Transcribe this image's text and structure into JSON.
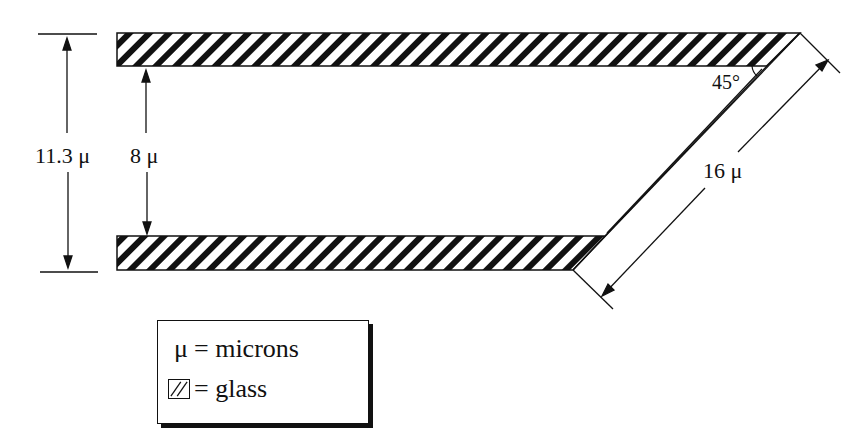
{
  "diagram": {
    "labels": {
      "outer_height": "11.3 μ",
      "inner_height": "8 μ",
      "diagonal_length": "16 μ",
      "angle": "45°"
    }
  },
  "legend": {
    "items": [
      {
        "symbol": "μ",
        "text": "= microns"
      },
      {
        "symbol": "glass-hatch-swatch",
        "text": "= glass"
      }
    ]
  },
  "colors": {
    "ink": "#111111",
    "background": "#ffffff"
  }
}
